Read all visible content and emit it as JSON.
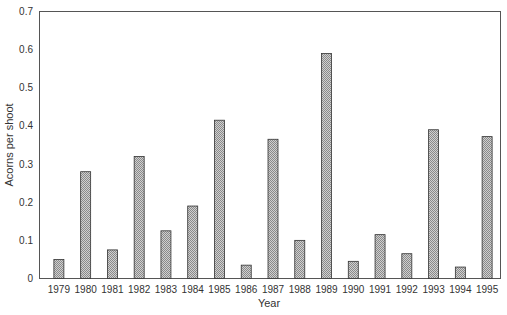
{
  "chart_data": {
    "type": "bar",
    "title": "",
    "xlabel": "Year",
    "ylabel": "Acorns per shoot",
    "ylim": [
      0,
      0.7
    ],
    "yticks": [
      "0",
      "0.1",
      "0.2",
      "0.3",
      "0.4",
      "0.5",
      "0.6",
      "0.7"
    ],
    "grid": false,
    "legend": null,
    "categories": [
      "1979",
      "1980",
      "1981",
      "1982",
      "1983",
      "1984",
      "1985",
      "1986",
      "1987",
      "1988",
      "1989",
      "1990",
      "1991",
      "1992",
      "1993",
      "1994",
      "1995"
    ],
    "values": [
      0.05,
      0.28,
      0.075,
      0.32,
      0.125,
      0.19,
      0.415,
      0.035,
      0.365,
      0.1,
      0.59,
      0.045,
      0.115,
      0.065,
      0.39,
      0.03,
      0.372
    ],
    "bar_fill": "#b8b8b8",
    "bar_stroke": "#333333"
  }
}
